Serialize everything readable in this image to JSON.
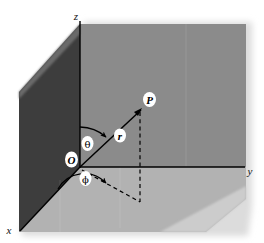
{
  "figure": {
    "background_color": "#ffffff",
    "width": 264,
    "height": 243
  },
  "planes": {
    "xz_plane": {
      "name": "xz-plane",
      "color": "#3d3d3d"
    },
    "yz_plane": {
      "name": "yz-plane",
      "color": "#8b8b8b"
    },
    "xy_plane": {
      "name": "xy-plane",
      "color": "#b2b2b2"
    },
    "shadow_color": "#d9d9d9"
  },
  "axes": [
    {
      "key": "z",
      "label": "z",
      "label_x": 76,
      "label_y": 20
    },
    {
      "key": "y",
      "label": "y",
      "label_x": 249,
      "label_y": 175
    },
    {
      "key": "x",
      "label": "x",
      "label_x": 8,
      "label_y": 233
    }
  ],
  "points": [
    {
      "key": "origin",
      "label": "O",
      "label_x": 68,
      "label_y": 163,
      "x": 80,
      "y": 167
    },
    {
      "key": "P",
      "label": "P",
      "label_x": 146,
      "label_y": 103,
      "x": 140,
      "y": 111
    }
  ],
  "segments": [
    {
      "key": "radius",
      "label": "r",
      "label_x": 117,
      "label_y": 139,
      "style": "solid",
      "from": "origin",
      "to": "P"
    },
    {
      "key": "vertical-drop",
      "label": "",
      "style": "dashed",
      "from": "P",
      "to": "projection"
    },
    {
      "key": "ground-projection",
      "label": "",
      "style": "dashed",
      "from": "origin",
      "to": "projection"
    }
  ],
  "angles": [
    {
      "key": "theta",
      "label": "θ",
      "label_x": 84,
      "label_y": 147,
      "description": "polar angle from z-axis to r"
    },
    {
      "key": "phi",
      "label": "ϕ",
      "label_x": 82,
      "label_y": 182,
      "description": "azimuthal angle from x-axis in xy-plane"
    }
  ],
  "line_color": "#000000"
}
